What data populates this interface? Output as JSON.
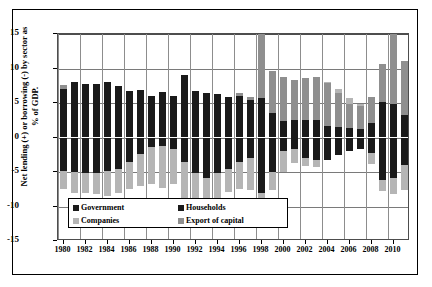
{
  "chart_data": {
    "type": "bar",
    "subtype": "stacked-diverging",
    "title": "",
    "xlabel": "",
    "ylabel": "Net lending (+) or borrowing (-) by sector as % of GDP.",
    "ylim": [
      -15,
      15
    ],
    "yticks": [
      15,
      10,
      5,
      0,
      -5,
      -10,
      -15
    ],
    "grid": true,
    "legend_position": "inside-bottom-left",
    "x": [
      1980,
      1981,
      1982,
      1983,
      1984,
      1985,
      1986,
      1987,
      1988,
      1989,
      1990,
      1991,
      1992,
      1993,
      1994,
      1995,
      1996,
      1997,
      1998,
      1999,
      2000,
      2001,
      2002,
      2003,
      2004,
      2005,
      2006,
      2007,
      2008,
      2009,
      2010,
      2011
    ],
    "xtick_labels": [
      "1980",
      "1982",
      "1984",
      "1986",
      "1988",
      "1990",
      "1992",
      "1994",
      "1996",
      "1998",
      "2000",
      "2002",
      "2004",
      "2006",
      "2008",
      "2010"
    ],
    "series": [
      {
        "name": "Government",
        "color": "#1a1a1a",
        "values": [
          -4.8,
          -5.0,
          -5.1,
          -5.2,
          -4.9,
          -4.6,
          -3.5,
          -2.4,
          -1.4,
          -1.2,
          -1.6,
          -3.5,
          -5.2,
          -5.8,
          -5.2,
          -4.5,
          -3.6,
          -3.0,
          -8.0,
          -5.0,
          -2.0,
          -1.6,
          -3.0,
          -3.3,
          -3.2,
          -2.6,
          -2.0,
          -1.6,
          -2.3,
          -6.2,
          -5.8,
          -4.0
        ]
      },
      {
        "name": "Households",
        "color": "#1a1a1a",
        "values": [
          7.0,
          8.0,
          7.7,
          7.8,
          8.1,
          7.4,
          6.8,
          6.9,
          6.0,
          6.6,
          6.0,
          9.0,
          6.7,
          6.4,
          6.3,
          5.8,
          6.0,
          5.5,
          5.7,
          3.6,
          2.4,
          2.5,
          2.6,
          2.6,
          1.6,
          1.5,
          1.4,
          1.3,
          2.1,
          5.2,
          4.8,
          3.3
        ]
      },
      {
        "name": "Companies",
        "color": "#b5b5b5",
        "values": [
          -2.6,
          -3.1,
          -2.9,
          -3.0,
          -3.6,
          -3.5,
          -3.9,
          -4.7,
          -5.3,
          -6.1,
          -5.2,
          -5.7,
          -4.0,
          -3.4,
          -3.6,
          -3.4,
          -3.8,
          -4.6,
          -5.0,
          -2.6,
          -3.0,
          -2.1,
          -1.2,
          -1.0,
          0.2,
          0.6,
          0.8,
          0.3,
          -1.6,
          -1.5,
          -2.4,
          -3.6
        ]
      },
      {
        "name": "Export of capital",
        "color": "#8f8f8f",
        "values": [
          0.6,
          0.0,
          0.0,
          0.0,
          0.0,
          0.0,
          0.0,
          0.0,
          0.0,
          0.0,
          0.0,
          0.0,
          0.0,
          0.0,
          0.0,
          0.0,
          0.5,
          0.4,
          13.2,
          6.0,
          6.3,
          5.9,
          6.0,
          6.1,
          6.3,
          4.9,
          3.5,
          3.3,
          3.7,
          5.4,
          11.0,
          7.8
        ]
      }
    ]
  },
  "legend": {
    "items": [
      {
        "label": "Government",
        "color": "#1a1a1a"
      },
      {
        "label": "Households",
        "color": "#1a1a1a"
      },
      {
        "label": "Companies",
        "color": "#b5b5b5"
      },
      {
        "label": "Export of capital",
        "color": "#8f8f8f"
      }
    ]
  }
}
